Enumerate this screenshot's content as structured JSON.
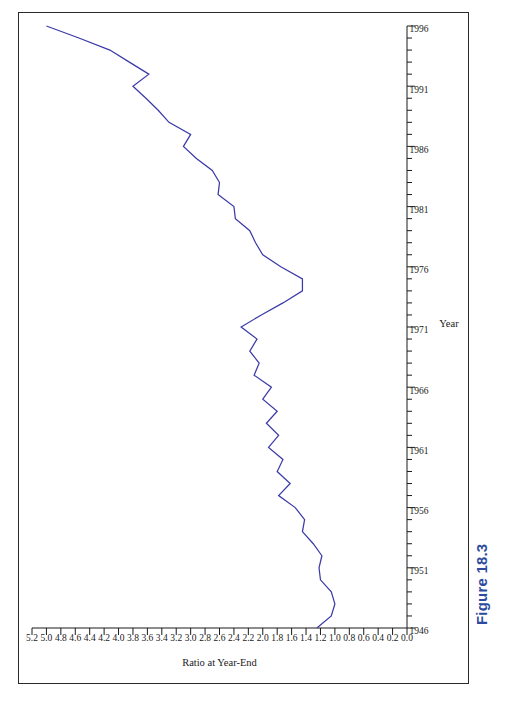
{
  "figure": {
    "caption": "Figure 18.3",
    "caption_color": "#2e4a9e"
  },
  "page": {
    "orientation": "landscape-rotated-90",
    "border_color": "#2a2a2a"
  },
  "chart_data": {
    "type": "line",
    "title": "",
    "xlabel": "Year",
    "ylabel": "Ratio at Year-End",
    "xlim": [
      1946,
      1996
    ],
    "ylim": [
      0.0,
      5.2
    ],
    "grid": false,
    "legend": null,
    "line_color": "#3b3ba8",
    "x_major_ticks": [
      1946,
      1951,
      1956,
      1961,
      1966,
      1971,
      1976,
      1981,
      1986,
      1991,
      1996
    ],
    "x_tick_labels": [
      "1946",
      "1951",
      "1956",
      "1961",
      "1966",
      "1971",
      "1976",
      "1981",
      "1986",
      "1991",
      "1996"
    ],
    "x_minor_tick_step": 1,
    "y_major_ticks": [
      0.0,
      0.2,
      0.4,
      0.6,
      0.8,
      1.0,
      1.2,
      1.4,
      1.6,
      1.8,
      2.0,
      2.2,
      2.4,
      2.6,
      2.8,
      3.0,
      3.2,
      3.4,
      3.6,
      3.8,
      4.0,
      4.2,
      4.4,
      4.6,
      4.8,
      5.0,
      5.2
    ],
    "y_tick_labels": [
      "0.0",
      "0.2",
      "0.4",
      "0.6",
      "0.8",
      "1.0",
      "1.2",
      "1.4",
      "1.6",
      "1.8",
      "2.0",
      "2.2",
      "2.4",
      "2.6",
      "2.8",
      "3.0",
      "3.2",
      "3.4",
      "3.6",
      "3.8",
      "4.0",
      "4.2",
      "4.4",
      "4.6",
      "4.8",
      "5.0",
      "5.2"
    ],
    "x": [
      1946,
      1947,
      1948,
      1949,
      1950,
      1951,
      1952,
      1953,
      1954,
      1955,
      1956,
      1957,
      1958,
      1959,
      1960,
      1961,
      1962,
      1963,
      1964,
      1965,
      1966,
      1967,
      1968,
      1969,
      1970,
      1971,
      1972,
      1973,
      1974,
      1975,
      1976,
      1977,
      1978,
      1979,
      1980,
      1981,
      1982,
      1983,
      1984,
      1985,
      1986,
      1987,
      1988,
      1989,
      1990,
      1991,
      1992,
      1993,
      1994,
      1995,
      1996
    ],
    "values": [
      1.25,
      1.05,
      1.0,
      1.05,
      1.2,
      1.22,
      1.18,
      1.3,
      1.45,
      1.42,
      1.55,
      1.78,
      1.62,
      1.8,
      1.72,
      1.92,
      1.78,
      1.95,
      1.8,
      2.0,
      1.88,
      2.12,
      2.05,
      2.18,
      2.08,
      2.3,
      2.02,
      1.72,
      1.45,
      1.45,
      1.75,
      2.0,
      2.1,
      2.18,
      2.38,
      2.4,
      2.62,
      2.6,
      2.7,
      2.92,
      3.1,
      3.0,
      3.3,
      3.45,
      3.62,
      3.8,
      3.58,
      3.85,
      4.12,
      4.55,
      5.0
    ]
  }
}
